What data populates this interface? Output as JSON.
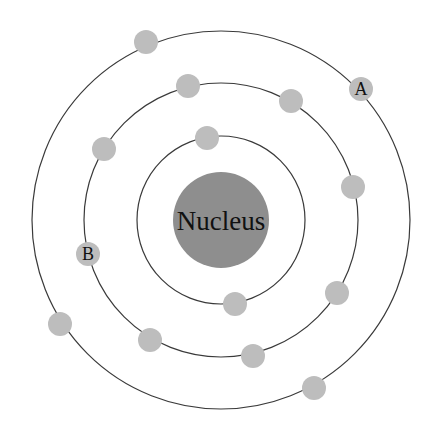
{
  "diagram": {
    "center": {
      "x": 221,
      "y": 220
    },
    "colors": {
      "orbit": "#3a3a3a",
      "nucleus": "#8e8e8e",
      "electron": "#bdbdbd",
      "text": "#111111",
      "background": "#ffffff"
    },
    "nucleus": {
      "label": "Nucleus",
      "radius": 48
    },
    "orbits": [
      {
        "name": "inner",
        "radius": 84,
        "electron_count": 2
      },
      {
        "name": "middle",
        "radius": 137,
        "electron_count": 8
      },
      {
        "name": "outer",
        "radius": 189,
        "electron_count": 4
      }
    ],
    "electrons": [
      {
        "orbit": "inner",
        "x": 207,
        "y": 138,
        "label": ""
      },
      {
        "orbit": "inner",
        "x": 235,
        "y": 304,
        "label": ""
      },
      {
        "orbit": "middle",
        "x": 188,
        "y": 86,
        "label": ""
      },
      {
        "orbit": "middle",
        "x": 291,
        "y": 101,
        "label": ""
      },
      {
        "orbit": "middle",
        "x": 104,
        "y": 149,
        "label": ""
      },
      {
        "orbit": "middle",
        "x": 353,
        "y": 187,
        "label": ""
      },
      {
        "orbit": "middle",
        "x": 88,
        "y": 254,
        "label": "B"
      },
      {
        "orbit": "middle",
        "x": 337,
        "y": 293,
        "label": ""
      },
      {
        "orbit": "middle",
        "x": 150,
        "y": 340,
        "label": ""
      },
      {
        "orbit": "middle",
        "x": 253,
        "y": 356,
        "label": ""
      },
      {
        "orbit": "outer",
        "x": 146,
        "y": 42,
        "label": ""
      },
      {
        "orbit": "outer",
        "x": 361,
        "y": 89,
        "label": "A"
      },
      {
        "orbit": "outer",
        "x": 60,
        "y": 324,
        "label": ""
      },
      {
        "orbit": "outer",
        "x": 314,
        "y": 388,
        "label": ""
      }
    ],
    "labels": {
      "nucleus": "Nucleus",
      "electron_a": "A",
      "electron_b": "B"
    }
  }
}
